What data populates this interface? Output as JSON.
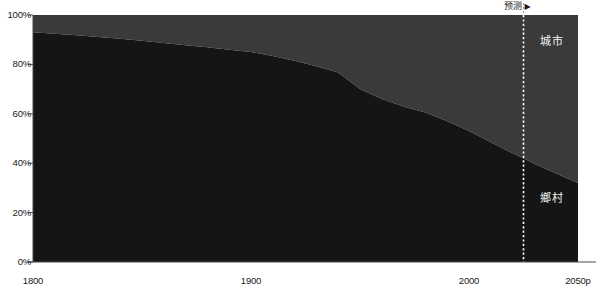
{
  "chart_data": {
    "type": "area",
    "stacked": true,
    "normalized_percent": true,
    "title": "",
    "subtitle": "",
    "xlabel": "",
    "ylabel": "",
    "xlim": [
      1800,
      2050
    ],
    "ylim": [
      0,
      100
    ],
    "grid": false,
    "legend_position": "in-plot",
    "x_tick_labels": [
      "1800",
      "1900",
      "2000",
      "2050p"
    ],
    "x_tick_values": [
      1800,
      1900,
      2000,
      2050
    ],
    "y_tick_labels": [
      "0%",
      "20%",
      "40%",
      "60%",
      "80%",
      "100%"
    ],
    "y_tick_values": [
      0,
      20,
      40,
      60,
      80,
      100
    ],
    "x": [
      1800,
      1810,
      1820,
      1830,
      1840,
      1850,
      1860,
      1870,
      1880,
      1890,
      1900,
      1910,
      1920,
      1930,
      1940,
      1950,
      1960,
      1970,
      1980,
      1990,
      2000,
      2010,
      2020,
      2025,
      2030,
      2040,
      2050
    ],
    "series": [
      {
        "name": "鄉村",
        "label": "鄉村",
        "color": "#151515",
        "values": [
          93.0,
          92.4,
          91.8,
          91.1,
          90.4,
          89.6,
          88.7,
          87.8,
          86.9,
          85.9,
          85.0,
          83.4,
          81.5,
          79.3,
          76.7,
          70.0,
          66.0,
          63.0,
          60.5,
          57.0,
          53.0,
          48.5,
          44.0,
          42.0,
          39.8,
          35.8,
          32.0
        ]
      },
      {
        "name": "城市",
        "label": "城市",
        "color": "#3a3a3a",
        "values": [
          7.0,
          7.6,
          8.2,
          8.9,
          9.6,
          10.4,
          11.3,
          12.2,
          13.1,
          14.1,
          15.0,
          16.6,
          18.5,
          20.7,
          23.3,
          30.0,
          34.0,
          37.0,
          39.5,
          43.0,
          47.0,
          51.5,
          56.0,
          58.0,
          60.2,
          64.2,
          68.0
        ]
      }
    ],
    "annotations": [
      {
        "name": "forecast-divider",
        "label": "预测",
        "arrow": "▶",
        "x_value": 2025,
        "style": "vertical-dotted-line"
      }
    ]
  },
  "colors": {
    "urban": "#3a3a3a",
    "rural": "#151515",
    "background": "#ffffff",
    "axis": "#4a4a4a",
    "tick_text": "#1a1a1a",
    "series_label_text": "#f2f2f2",
    "forecast_line": "#ffffff",
    "forecast_text": "#1a1a1a"
  }
}
